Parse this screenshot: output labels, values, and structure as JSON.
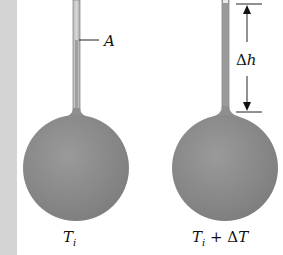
{
  "diagram": {
    "left_thermometer": {
      "label_main": "T",
      "label_sub": "i",
      "stem_label": "A"
    },
    "right_thermometer": {
      "label_main": "T",
      "label_sub": "i",
      "label_suffix_op": " + ",
      "label_suffix_delta": "Δ",
      "label_suffix_var": "T",
      "height_change_delta": "Δ",
      "height_change_var": "h"
    },
    "colors": {
      "bulb": "#8a8a8a",
      "stem": "#9a9a9a",
      "strip": "#d4d4d4",
      "ink": "#111111"
    }
  }
}
